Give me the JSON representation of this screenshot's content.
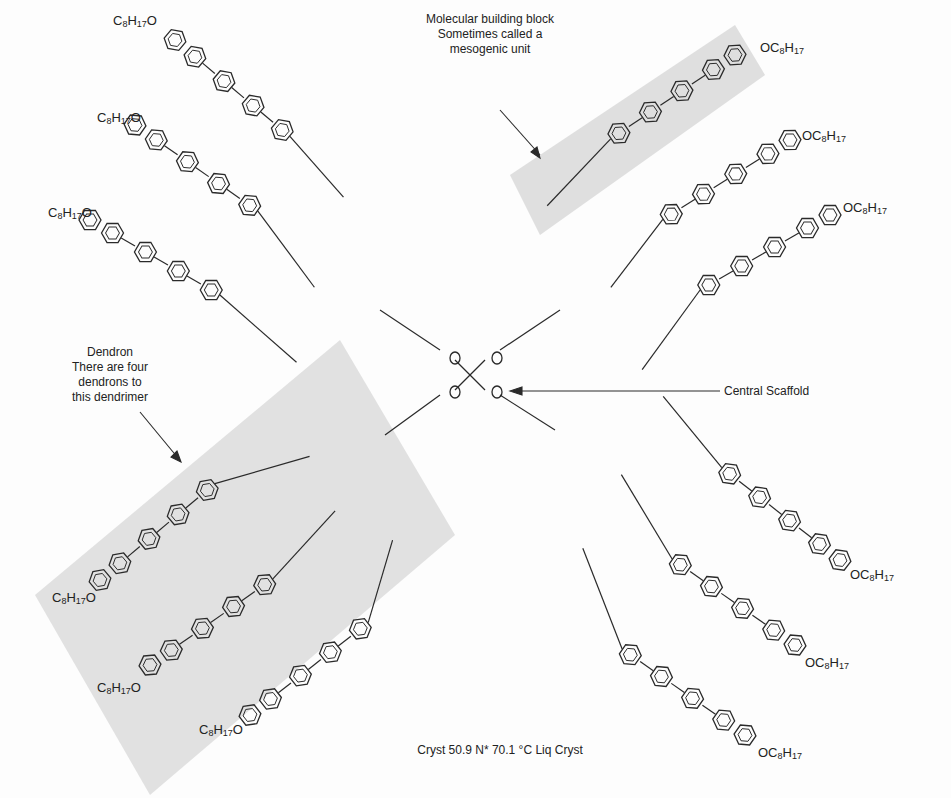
{
  "figure": {
    "annotations": {
      "building_block": {
        "lines": [
          "Molecular building block",
          "Sometimes called a",
          "mesogenic unit"
        ]
      },
      "dendron": {
        "lines": [
          "Dendron",
          "There are four",
          "dendrons to",
          "this dendrimer"
        ]
      },
      "central_scaffold": {
        "text": "Central Scaffold"
      },
      "phase_transition": {
        "text": "Cryst 50.9 N* 70.1 °C Liq Cryst"
      }
    },
    "chem_labels": {
      "terminal_group_left": "C8H17O",
      "terminal_group_right": "OC8H17",
      "silicon": "Si",
      "oxygen": "O"
    },
    "highlight_color": "#d9d9d9",
    "line_color": "#2a2a2a",
    "terminal_labels_left": [
      {
        "x": 113,
        "y": 13
      },
      {
        "x": 97,
        "y": 110
      },
      {
        "x": 48,
        "y": 205
      },
      {
        "x": 52,
        "y": 590
      },
      {
        "x": 97,
        "y": 680
      },
      {
        "x": 199,
        "y": 722
      }
    ],
    "terminal_labels_right": [
      {
        "x": 760,
        "y": 40
      },
      {
        "x": 802,
        "y": 128
      },
      {
        "x": 843,
        "y": 200
      },
      {
        "x": 850,
        "y": 567
      },
      {
        "x": 805,
        "y": 655
      },
      {
        "x": 758,
        "y": 745
      }
    ]
  }
}
